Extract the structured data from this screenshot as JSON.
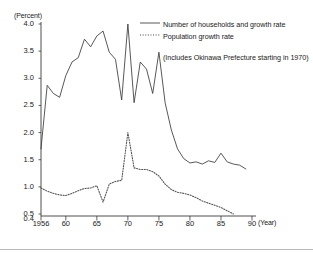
{
  "chart_data": {
    "type": "line",
    "title": "",
    "subtitle": "",
    "xlabel": "(Year)",
    "ylabel": "(Percent)",
    "xlim": [
      1956,
      1990
    ],
    "ylim": [
      0.4,
      4.0
    ],
    "grid": false,
    "legend_position": "top-right",
    "y_ticks": [
      "4.0",
      "3.5",
      "3.0",
      "2.5",
      "2.0",
      "1.5",
      "1.0",
      "0.5",
      "0.4"
    ],
    "y_tick_values": [
      4.0,
      3.5,
      3.0,
      2.5,
      2.0,
      1.5,
      1.0,
      0.5,
      0.4
    ],
    "x_ticks": [
      "1956",
      "60",
      "65",
      "70",
      "75",
      "80",
      "85",
      "90"
    ],
    "x_tick_values": [
      1956,
      1960,
      1965,
      1970,
      1975,
      1980,
      1985,
      1990
    ],
    "annotations": [
      "(Includes Okinawa Prefecture starting in 1970)"
    ],
    "series": [
      {
        "name": "Number of households and growth rate",
        "style": "solid",
        "color": "#3a3a3a",
        "x": [
          1956,
          1957,
          1958,
          1959,
          1960,
          1961,
          1962,
          1963,
          1964,
          1965,
          1966,
          1967,
          1968,
          1969,
          1970,
          1971,
          1972,
          1973,
          1974,
          1975,
          1976,
          1977,
          1978,
          1979,
          1980,
          1981,
          1982,
          1983,
          1984,
          1985,
          1986,
          1987,
          1988,
          1989
        ],
        "values": [
          1.7,
          2.87,
          2.72,
          2.65,
          3.05,
          3.3,
          3.38,
          3.72,
          3.58,
          3.78,
          3.87,
          3.48,
          3.35,
          2.6,
          4.0,
          2.55,
          3.3,
          3.17,
          2.72,
          3.48,
          2.55,
          2.05,
          1.7,
          1.52,
          1.44,
          1.46,
          1.42,
          1.48,
          1.45,
          1.62,
          1.46,
          1.42,
          1.4,
          1.33
        ]
      },
      {
        "name": "Population growth rate",
        "style": "dotted",
        "color": "#555555",
        "x": [
          1956,
          1957,
          1958,
          1959,
          1960,
          1961,
          1962,
          1963,
          1964,
          1965,
          1966,
          1967,
          1968,
          1969,
          1970,
          1971,
          1972,
          1973,
          1974,
          1975,
          1976,
          1977,
          1978,
          1979,
          1980,
          1981,
          1982,
          1983,
          1984,
          1985,
          1986,
          1987
        ],
        "values": [
          0.98,
          0.92,
          0.88,
          0.85,
          0.84,
          0.88,
          0.93,
          0.97,
          0.98,
          1.02,
          0.72,
          1.05,
          1.1,
          1.12,
          2.0,
          1.35,
          1.32,
          1.32,
          1.28,
          1.2,
          1.05,
          0.95,
          0.9,
          0.88,
          0.85,
          0.8,
          0.74,
          0.7,
          0.66,
          0.62,
          0.56,
          0.5
        ]
      }
    ]
  },
  "legend": {
    "entry1": "Number of households and growth rate",
    "entry2": "Population growth rate",
    "note": "(Includes Okinawa Prefecture starting in 1970)"
  },
  "axes": {
    "y_unit": "(Percent)",
    "x_unit": "(Year)"
  }
}
